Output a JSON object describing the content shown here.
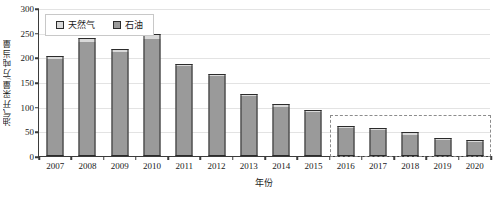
{
  "chart_data": {
    "type": "bar",
    "title": "",
    "subtitle": "",
    "xlabel": "年份",
    "ylabel": "油气开采量/万吨当量",
    "categories": [
      "2007",
      "2008",
      "2009",
      "2010",
      "2011",
      "2012",
      "2013",
      "2014",
      "2015",
      "2016",
      "2017",
      "2018",
      "2019",
      "2020"
    ],
    "series": [
      {
        "name": "石油",
        "color": "#9a9a9a",
        "values": [
          196,
          231,
          210,
          238,
          182,
          163,
          122,
          101,
          91,
          59,
          55,
          46,
          35,
          31
        ]
      },
      {
        "name": "天然气",
        "color": "#d9d9d9",
        "values": [
          7,
          8,
          7,
          9,
          5,
          4,
          4,
          4,
          3,
          2,
          2,
          2,
          2,
          2
        ]
      }
    ],
    "totals": [
      203,
      239,
      217,
      247,
      187,
      167,
      126,
      105,
      94,
      61,
      57,
      48,
      37,
      33
    ],
    "stacked": true,
    "ylim": [
      0,
      300
    ],
    "ytick_step": 50,
    "yticks": [
      "0",
      "50",
      "100",
      "150",
      "200",
      "250",
      "300"
    ],
    "grid": true,
    "legend_position": "top-left",
    "annotations": [
      {
        "name": "forecast-region",
        "style": "dashed-rectangle",
        "color": "#8c8c8c",
        "from_category": "2016",
        "to_category": "2020",
        "y_top": 85
      }
    ]
  },
  "legend": {
    "items": [
      {
        "label": "天然气",
        "swatch": "#d9d9d9"
      },
      {
        "label": "石油",
        "swatch": "#9a9a9a"
      }
    ]
  }
}
